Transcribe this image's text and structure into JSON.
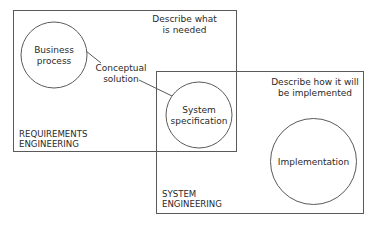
{
  "diagram": {
    "requirements_box": {
      "title_line1": "REQUIREMENTS",
      "title_line2": "ENGINEERING",
      "note_line1": "Describe what",
      "note_line2": "is needed"
    },
    "system_box": {
      "title_line1": "SYSTEM",
      "title_line2": "ENGINEERING",
      "note_line1": "Describe how it will",
      "note_line2": "be implemented"
    },
    "nodes": {
      "business_process": {
        "line1": "Business",
        "line2": "process"
      },
      "system_specification": {
        "line1": "System",
        "line2": "specification"
      },
      "implementation": {
        "line1": "Implementation"
      }
    },
    "connector_label": {
      "line1": "Conceptual",
      "line2": "solution"
    },
    "colors": {
      "stroke": "#5a5a5a",
      "text": "#2a2a2a",
      "background": "#ffffff"
    }
  }
}
